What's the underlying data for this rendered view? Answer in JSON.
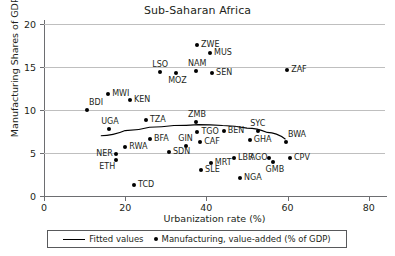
{
  "chart_data": {
    "type": "scatter",
    "title": "Sub-Saharan Africa",
    "xlabel": "Urbanization rate (%)",
    "ylabel": "Manufacturing Shares of GDP (%)",
    "xlim": [
      0,
      84
    ],
    "ylim": [
      0,
      20
    ],
    "xticks": [
      0,
      20,
      40,
      60,
      80
    ],
    "yticks": [
      0,
      5,
      10,
      15,
      20
    ],
    "grid": "horizontal",
    "legend_position": "below-axis",
    "legend": [
      {
        "label": "Fitted values",
        "marker": "line"
      },
      {
        "label": "Manufacturing, value-added (% of GDP)",
        "marker": "dot"
      }
    ],
    "points": [
      {
        "code": "ZWE",
        "x": 37.7,
        "y": 17.6,
        "label_pos": "right"
      },
      {
        "code": "MUS",
        "x": 40.9,
        "y": 16.6,
        "label_pos": "right"
      },
      {
        "code": "ZAF",
        "x": 59.9,
        "y": 14.7,
        "label_pos": "right"
      },
      {
        "code": "NAM",
        "x": 37.4,
        "y": 14.5,
        "label_pos": "above"
      },
      {
        "code": "SEN",
        "x": 41.4,
        "y": 14.3,
        "label_pos": "right"
      },
      {
        "code": "LSO",
        "x": 28.6,
        "y": 14.4,
        "label_pos": "above"
      },
      {
        "code": "MOZ",
        "x": 32.5,
        "y": 14.3,
        "label_pos": "below"
      },
      {
        "code": "MWI",
        "x": 15.8,
        "y": 11.9,
        "label_pos": "right"
      },
      {
        "code": "KEN",
        "x": 21.2,
        "y": 11.2,
        "label_pos": "right"
      },
      {
        "code": "BDI",
        "x": 10.6,
        "y": 10.0,
        "label_pos": "above-right"
      },
      {
        "code": "TZA",
        "x": 25.1,
        "y": 8.8,
        "label_pos": "right"
      },
      {
        "code": "ZMB",
        "x": 37.4,
        "y": 8.6,
        "label_pos": "above"
      },
      {
        "code": "UGA",
        "x": 16.0,
        "y": 7.8,
        "label_pos": "above"
      },
      {
        "code": "SYC",
        "x": 52.7,
        "y": 7.6,
        "label_pos": "above"
      },
      {
        "code": "BEN",
        "x": 44.3,
        "y": 7.6,
        "label_pos": "right"
      },
      {
        "code": "TGO",
        "x": 37.8,
        "y": 7.5,
        "label_pos": "right"
      },
      {
        "code": "BFA",
        "x": 26.1,
        "y": 6.6,
        "label_pos": "right"
      },
      {
        "code": "GIN",
        "x": 35.0,
        "y": 5.8,
        "label_pos": "above"
      },
      {
        "code": "CAF",
        "x": 38.5,
        "y": 6.3,
        "label_pos": "right"
      },
      {
        "code": "GHA",
        "x": 50.7,
        "y": 6.5,
        "label_pos": "right"
      },
      {
        "code": "BWA",
        "x": 59.6,
        "y": 6.3,
        "label_pos": "above-right"
      },
      {
        "code": "RWA",
        "x": 20.0,
        "y": 5.7,
        "label_pos": "right"
      },
      {
        "code": "SDN",
        "x": 30.8,
        "y": 5.1,
        "label_pos": "right"
      },
      {
        "code": "NER",
        "x": 17.7,
        "y": 4.9,
        "label_pos": "left"
      },
      {
        "code": "ETH",
        "x": 17.7,
        "y": 4.2,
        "label_pos": "below-left"
      },
      {
        "code": "AGO",
        "x": 55.5,
        "y": 4.4,
        "label_pos": "left"
      },
      {
        "code": "GMB",
        "x": 56.5,
        "y": 3.9,
        "label_pos": "below"
      },
      {
        "code": "CPV",
        "x": 60.6,
        "y": 4.4,
        "label_pos": "right"
      },
      {
        "code": "LBR",
        "x": 46.8,
        "y": 4.4,
        "label_pos": "right"
      },
      {
        "code": "MRT",
        "x": 41.1,
        "y": 3.8,
        "label_pos": "right"
      },
      {
        "code": "SLE",
        "x": 38.7,
        "y": 3.0,
        "label_pos": "right"
      },
      {
        "code": "NGA",
        "x": 48.3,
        "y": 2.1,
        "label_pos": "right"
      },
      {
        "code": "TCD",
        "x": 22.2,
        "y": 1.3,
        "label_pos": "right"
      }
    ],
    "fitted_curve": [
      {
        "x": 14.0,
        "y": 7.0
      },
      {
        "x": 20.0,
        "y": 7.6
      },
      {
        "x": 26.0,
        "y": 8.0
      },
      {
        "x": 32.0,
        "y": 8.2
      },
      {
        "x": 38.0,
        "y": 8.3
      },
      {
        "x": 44.0,
        "y": 8.2
      },
      {
        "x": 50.0,
        "y": 7.9
      },
      {
        "x": 55.0,
        "y": 7.4
      },
      {
        "x": 59.5,
        "y": 6.6
      }
    ]
  }
}
